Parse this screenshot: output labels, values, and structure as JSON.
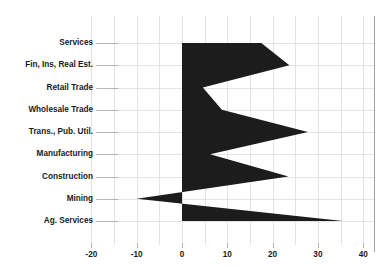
{
  "chart_data": {
    "type": "area",
    "orientation": "horizontal",
    "title": "",
    "subtitle": "",
    "xlabel": "",
    "ylabel": "",
    "categories": [
      "Services",
      "Fin, Ins, Real Est.",
      "Retail Trade",
      "Wholesale Trade",
      "Trans., Pub. Util.",
      "Manufacturing",
      "Construction",
      "Mining",
      "Ag. Services"
    ],
    "values": [
      17.5,
      23.7,
      4.6,
      8.8,
      27.8,
      6.2,
      23.5,
      -10.0,
      35.5
    ],
    "series": [
      {
        "name": "Percent Change",
        "values": [
          17.5,
          23.7,
          4.6,
          8.8,
          27.8,
          6.2,
          23.5,
          -10.0,
          35.5
        ]
      }
    ],
    "xlim": [
      -20,
      40
    ],
    "xticks": [
      -20,
      -10,
      0,
      10,
      20,
      30,
      40
    ],
    "xtick_labels": [
      "-20",
      "-10",
      "0",
      "10",
      "20",
      "30",
      "40"
    ],
    "minor_xticks": [
      -15,
      -5,
      5,
      15,
      25,
      35
    ],
    "grid": true,
    "legend": false,
    "legend_position": "none",
    "baseline": 0,
    "colors": {
      "series_fill": "#1c1c1c",
      "gridline": "#d9d9d9",
      "text": "#1a1a1a",
      "background": "#ffffff"
    }
  },
  "axis": {
    "x_tick_labels": [
      "-20",
      "-10",
      "0",
      "10",
      "20",
      "30",
      "40"
    ],
    "y_category_labels": [
      "Services",
      "Fin, Ins, Real Est.",
      "Retail Trade",
      "Wholesale Trade",
      "Trans., Pub. Util.",
      "Manufacturing",
      "Construction",
      "Mining",
      "Ag. Services"
    ]
  }
}
